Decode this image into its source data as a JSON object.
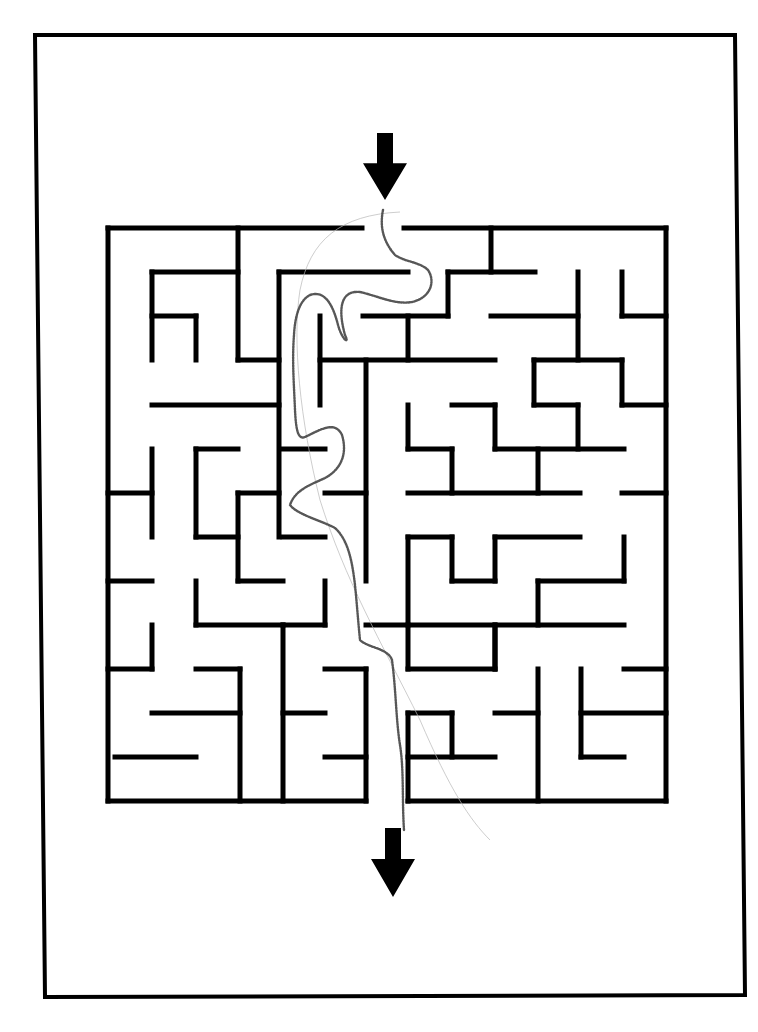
{
  "page": {
    "background": "#ffffff",
    "ink_color": "#000000",
    "pencil_color": "#3a3a3a",
    "border": {
      "points": [
        [
          35,
          35
        ],
        [
          735,
          35
        ],
        [
          745,
          995
        ],
        [
          45,
          997
        ]
      ]
    }
  },
  "maze": {
    "entrance_arrow": {
      "x": 385,
      "top": 133,
      "bottom": 200,
      "direction": "down"
    },
    "exit_arrow": {
      "x": 393,
      "top": 828,
      "bottom": 897,
      "direction": "down"
    },
    "walls": [
      [
        108,
        228,
        362,
        228
      ],
      [
        404,
        228,
        666,
        228
      ],
      [
        108,
        228,
        108,
        801
      ],
      [
        666,
        228,
        666,
        801
      ],
      [
        108,
        801,
        366,
        801
      ],
      [
        408,
        801,
        666,
        801
      ],
      [
        238,
        228,
        238,
        360
      ],
      [
        238,
        360,
        279,
        360
      ],
      [
        152,
        272,
        238,
        272
      ],
      [
        152,
        272,
        152,
        360
      ],
      [
        152,
        316,
        196,
        316
      ],
      [
        196,
        316,
        196,
        360
      ],
      [
        279,
        272,
        279,
        537
      ],
      [
        279,
        272,
        408,
        272
      ],
      [
        363,
        316,
        448,
        316
      ],
      [
        448,
        272,
        448,
        316
      ],
      [
        448,
        272,
        535,
        272
      ],
      [
        491,
        228,
        491,
        272
      ],
      [
        408,
        316,
        408,
        360
      ],
      [
        320,
        360,
        495,
        360
      ],
      [
        320,
        316,
        320,
        405
      ],
      [
        491,
        316,
        578,
        316
      ],
      [
        578,
        272,
        578,
        360
      ],
      [
        622,
        272,
        622,
        316
      ],
      [
        622,
        316,
        666,
        316
      ],
      [
        534,
        360,
        622,
        360
      ],
      [
        534,
        360,
        534,
        405
      ],
      [
        534,
        405,
        578,
        405
      ],
      [
        578,
        405,
        578,
        449
      ],
      [
        622,
        360,
        622,
        405
      ],
      [
        622,
        405,
        666,
        405
      ],
      [
        152,
        405,
        279,
        405
      ],
      [
        366,
        360,
        366,
        581
      ],
      [
        408,
        405,
        408,
        449
      ],
      [
        408,
        449,
        452,
        449
      ],
      [
        452,
        449,
        452,
        493
      ],
      [
        452,
        405,
        495,
        405
      ],
      [
        495,
        405,
        495,
        449
      ],
      [
        495,
        449,
        624,
        449
      ],
      [
        538,
        449,
        538,
        493
      ],
      [
        408,
        493,
        580,
        493
      ],
      [
        622,
        493,
        666,
        493
      ],
      [
        152,
        449,
        152,
        537
      ],
      [
        108,
        493,
        152,
        493
      ],
      [
        196,
        449,
        238,
        449
      ],
      [
        196,
        449,
        196,
        537
      ],
      [
        196,
        537,
        238,
        537
      ],
      [
        238,
        493,
        279,
        493
      ],
      [
        238,
        493,
        238,
        581
      ],
      [
        238,
        581,
        283,
        581
      ],
      [
        283,
        449,
        325,
        449
      ],
      [
        283,
        537,
        325,
        537
      ],
      [
        325,
        493,
        366,
        493
      ],
      [
        325,
        581,
        325,
        625
      ],
      [
        283,
        625,
        325,
        625
      ],
      [
        108,
        581,
        152,
        581
      ],
      [
        196,
        581,
        196,
        625
      ],
      [
        196,
        625,
        283,
        625
      ],
      [
        408,
        537,
        408,
        625
      ],
      [
        408,
        537,
        452,
        537
      ],
      [
        452,
        537,
        452,
        581
      ],
      [
        452,
        581,
        495,
        581
      ],
      [
        495,
        537,
        495,
        581
      ],
      [
        495,
        537,
        580,
        537
      ],
      [
        624,
        537,
        624,
        581
      ],
      [
        538,
        581,
        624,
        581
      ],
      [
        538,
        581,
        538,
        625
      ],
      [
        366,
        625,
        624,
        625
      ],
      [
        408,
        625,
        408,
        669
      ],
      [
        495,
        625,
        495,
        669
      ],
      [
        152,
        625,
        152,
        669
      ],
      [
        108,
        669,
        152,
        669
      ],
      [
        196,
        669,
        240,
        669
      ],
      [
        240,
        669,
        240,
        801
      ],
      [
        152,
        713,
        240,
        713
      ],
      [
        115,
        757,
        196,
        757
      ],
      [
        283,
        625,
        283,
        801
      ],
      [
        283,
        713,
        325,
        713
      ],
      [
        325,
        669,
        366,
        669
      ],
      [
        366,
        669,
        366,
        801
      ],
      [
        325,
        757,
        366,
        757
      ],
      [
        495,
        669,
        495,
        625
      ],
      [
        408,
        669,
        495,
        669
      ],
      [
        408,
        713,
        452,
        713
      ],
      [
        452,
        713,
        452,
        757
      ],
      [
        408,
        757,
        495,
        757
      ],
      [
        408,
        713,
        408,
        801
      ],
      [
        495,
        713,
        538,
        713
      ],
      [
        538,
        669,
        538,
        801
      ],
      [
        581,
        669,
        581,
        757
      ],
      [
        581,
        757,
        624,
        757
      ],
      [
        581,
        713,
        666,
        713
      ],
      [
        624,
        669,
        666,
        669
      ]
    ]
  },
  "solution_path": {
    "points": "M383,210 C380,225 382,240 395,255 C405,262 420,262 428,270 C436,282 430,298 412,302 C395,305 378,296 360,292 C340,290 338,310 345,335 C350,345 342,340 338,325 C333,305 325,290 310,295 C300,300 295,315 294,335 C292,360 294,385 295,410 C296,430 298,440 305,437 C320,430 335,420 342,435 C348,455 340,470 325,478 C310,485 295,490 290,505 C298,515 320,520 335,528 C348,540 352,560 355,585 C357,605 358,620 360,640 C368,648 388,648 392,660 C396,690 396,720 400,745 C404,770 402,800 404,830",
    "faint_line": "M400,212 C340,215 310,240 300,290 C292,340 300,420 320,500 C345,580 380,640 420,720 C450,790 470,820 490,840"
  }
}
